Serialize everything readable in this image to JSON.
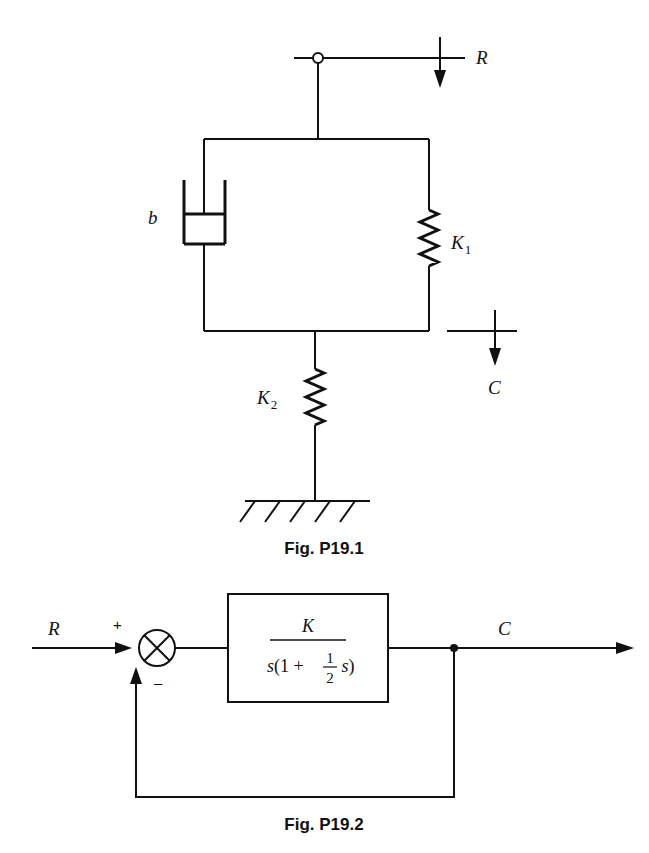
{
  "figures": [
    {
      "caption": "Fig. P19.1",
      "type": "mechanical-system",
      "labels": {
        "input": "R",
        "output": "C",
        "damper": "b",
        "spring1": "K",
        "spring1_sub": "1",
        "spring2": "K",
        "spring2_sub": "2"
      }
    },
    {
      "caption": "Fig. P19.2",
      "type": "block-diagram",
      "labels": {
        "input": "R",
        "output": "C",
        "plus_sign": "+",
        "minus_sign": "–",
        "tf_numerator": "K",
        "tf_den_s": "s",
        "tf_den_open": "(1 + ",
        "tf_frac_num": "1",
        "tf_frac_den": "2",
        "tf_den_s2": " s",
        "tf_den_close": ")"
      }
    }
  ]
}
